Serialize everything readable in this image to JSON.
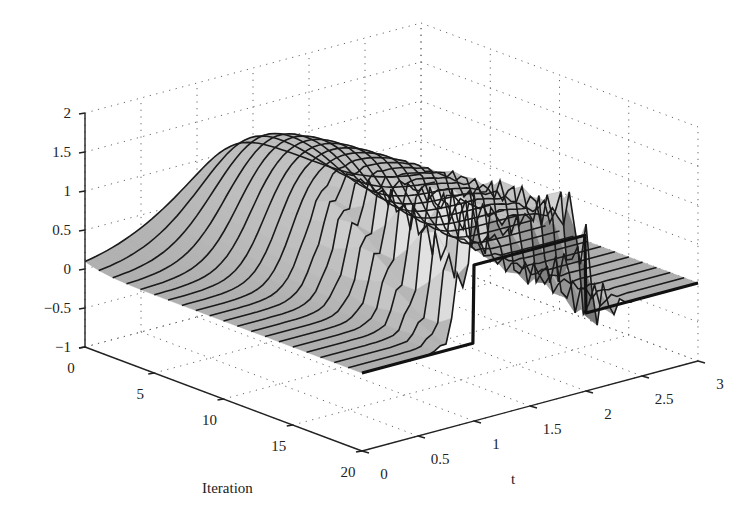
{
  "chart_data": {
    "type": "surface3d",
    "title": "",
    "xlabel": "Iteration",
    "ylabel": "t",
    "zlabel": "",
    "x_ticks": [
      "0",
      "5",
      "10",
      "15",
      "20"
    ],
    "y_ticks": [
      "0",
      "0.5",
      "1",
      "1.5",
      "2",
      "2.5",
      "3"
    ],
    "z_ticks": [
      "-1",
      "-0.5",
      "0",
      "0.5",
      "1",
      "1.5",
      "2"
    ],
    "xlim": [
      0,
      20
    ],
    "ylim": [
      0,
      3
    ],
    "zlim": [
      -1,
      2
    ],
    "grid": true,
    "series": [
      {
        "name": "reference (iteration 20)",
        "x": 20,
        "t": [
          0,
          0.99,
          1.0,
          1.99,
          2.0,
          3.0
        ],
        "values": [
          0,
          0,
          1,
          1,
          0,
          0
        ]
      },
      {
        "name": "iteration 0",
        "t": [
          0,
          0.5,
          0.8,
          1.0,
          1.3,
          1.6,
          2.0,
          2.3,
          3.0
        ],
        "values": [
          0,
          0.02,
          0.3,
          0.9,
          1.4,
          1.2,
          0.6,
          0.2,
          0
        ]
      },
      {
        "name": "iteration 10",
        "t": [
          0,
          0.5,
          0.9,
          1.0,
          1.3,
          1.6,
          2.0,
          2.2,
          3.0
        ],
        "values": [
          0,
          0.0,
          0.4,
          1.1,
          1.3,
          1.1,
          0.4,
          0.1,
          0
        ]
      },
      {
        "name": "iteration 20",
        "t": [
          0,
          0.5,
          0.9,
          1.0,
          1.1,
          1.5,
          1.9,
          2.0,
          2.1,
          2.5,
          3.0
        ],
        "values": [
          0,
          -0.1,
          -0.6,
          1.3,
          0.8,
          1.2,
          1.4,
          -0.6,
          0.3,
          -0.2,
          0
        ]
      }
    ]
  },
  "axes": {
    "x_label": "Iteration",
    "y_label": "t"
  }
}
